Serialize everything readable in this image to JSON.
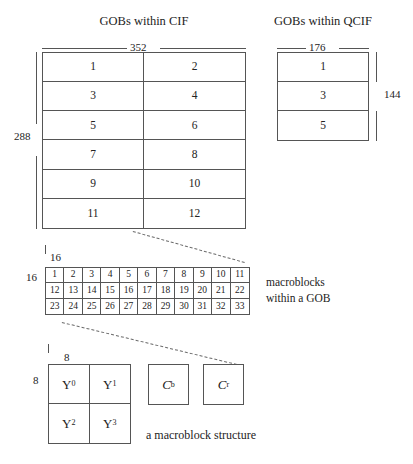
{
  "figure": {
    "caption": "a macroblock structure",
    "note_line1": "macroblocks",
    "note_line2": "within a GOB"
  },
  "cif": {
    "title": "GOBs within CIF",
    "width_label": "352",
    "height_label": "288",
    "columns": 2,
    "rows": 6,
    "cells": [
      "1",
      "2",
      "3",
      "4",
      "5",
      "6",
      "7",
      "8",
      "9",
      "10",
      "11",
      "12"
    ]
  },
  "qcif": {
    "title": "GOBs within QCIF",
    "width_label": "176",
    "height_label": "144",
    "columns": 1,
    "rows": 3,
    "cells": [
      "1",
      "3",
      "5"
    ]
  },
  "macroblocks": {
    "width_label": "16",
    "height_label": "16",
    "columns": 11,
    "rows": 3,
    "cells": [
      "1",
      "2",
      "3",
      "4",
      "5",
      "6",
      "7",
      "8",
      "9",
      "10",
      "11",
      "12",
      "13",
      "14",
      "15",
      "16",
      "17",
      "18",
      "19",
      "20",
      "21",
      "22",
      "23",
      "24",
      "25",
      "26",
      "27",
      "28",
      "29",
      "30",
      "31",
      "32",
      "33"
    ]
  },
  "macroblock_structure": {
    "width_label": "8",
    "height_label": "8",
    "luma_blocks": [
      {
        "symbol": "Y",
        "subscript": "0"
      },
      {
        "symbol": "Y",
        "subscript": "1"
      },
      {
        "symbol": "Y",
        "subscript": "2"
      },
      {
        "symbol": "Y",
        "subscript": "3"
      }
    ],
    "chroma_blocks": [
      {
        "symbol": "C",
        "subscript": "b"
      },
      {
        "symbol": "C",
        "subscript": "r"
      }
    ]
  },
  "colors": {
    "line": "#555555",
    "text": "#232323",
    "leader": "#6a6a6a",
    "background": "#ffffff"
  }
}
